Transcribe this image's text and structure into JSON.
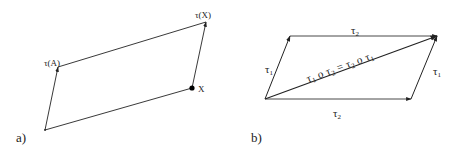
{
  "figure": {
    "panel_a": {
      "label": "a)",
      "points": {
        "A": [
          45,
          130
        ],
        "tau_A": [
          58,
          67
        ],
        "X": [
          192,
          88
        ],
        "tau_X": [
          206,
          22
        ]
      },
      "labels": {
        "tau_A": "τ(A)",
        "tau_X": "τ(X)",
        "X": "X"
      },
      "colors": {
        "line": "#222222",
        "dot": "#000000"
      }
    },
    "panel_b": {
      "label": "b)",
      "points": {
        "origin": [
          265,
          99
        ],
        "top_left": [
          290,
          36
        ],
        "top_right": [
          437,
          36
        ],
        "bottom_right": [
          411,
          99
        ]
      },
      "labels": {
        "top_edge": {
          "base": "τ",
          "sub": "2"
        },
        "left_edge": {
          "base": "τ",
          "sub": "1"
        },
        "right_edge": {
          "base": "τ",
          "sub": "1"
        },
        "bottom_edge": {
          "base": "τ",
          "sub": "2"
        },
        "diagonal": {
          "parts": [
            "τ",
            "1",
            " o ",
            "τ",
            "2",
            " = ",
            "τ",
            "2",
            " o ",
            "τ",
            "1"
          ]
        }
      },
      "colors": {
        "line": "#222222"
      }
    }
  }
}
